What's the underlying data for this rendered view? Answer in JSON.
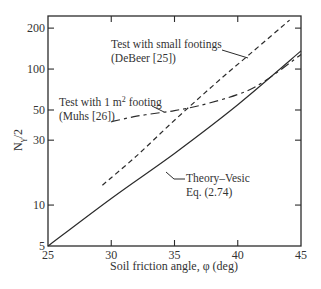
{
  "chart_data": {
    "type": "line",
    "title": "",
    "xlabel": "Soil friction angle, φ (deg)",
    "ylabel": "Nγ/2",
    "ylabel_main": "N",
    "ylabel_sub": "γ",
    "ylabel_tail": "/2",
    "xlim": [
      25,
      45
    ],
    "ylim": [
      5,
      250
    ],
    "yscale": "log",
    "grid": false,
    "x_ticks": [
      25,
      30,
      35,
      40,
      45
    ],
    "x_tick_labels": [
      "25",
      "30",
      "35",
      "40",
      "45"
    ],
    "y_ticks": [
      5,
      10,
      30,
      50,
      100,
      200
    ],
    "y_tick_labels": [
      "5",
      "10",
      "30",
      "50",
      "100",
      "200"
    ],
    "series": [
      {
        "name": "Theory–Vesic Eq. (2.74)",
        "style": "solid",
        "x": [
          25,
          30,
          35,
          40,
          45
        ],
        "values": [
          5.0,
          11.2,
          24.0,
          54.7,
          135.9
        ]
      },
      {
        "name": "Test with small footings (DeBeer [25])",
        "style": "dashed",
        "x": [
          29.3,
          32,
          35,
          38,
          41,
          44.1
        ],
        "values": [
          14,
          23,
          42,
          75,
          130,
          229
        ]
      },
      {
        "name": "Test with 1 m² footing (Muhs [26])",
        "style": "dashdot",
        "x": [
          30,
          32,
          34,
          35,
          37,
          40,
          42,
          45
        ],
        "values": [
          41,
          45,
          48,
          49.5,
          54,
          65,
          80,
          128
        ]
      }
    ],
    "annotations": [
      {
        "lines": [
          "Test with small footings",
          "(DeBeer [25])"
        ],
        "target": "dashed"
      },
      {
        "lines": [
          "Test with 1 m² footing",
          "(Muhs [26])"
        ],
        "target": "dashdot"
      },
      {
        "lines": [
          "Theory–Vesic",
          "Eq. (2.74)"
        ],
        "target": "solid"
      }
    ]
  },
  "labels": {
    "annot_debeer_1": "Test with small footings",
    "annot_debeer_2": "(DeBeer [25])",
    "annot_muhs_1a": "Test with 1 m",
    "annot_muhs_1sup": "2",
    "annot_muhs_1b": " footing",
    "annot_muhs_2": "(Muhs [26])",
    "annot_vesic_1": "Theory–Vesic",
    "annot_vesic_2": "Eq. (2.74)"
  }
}
